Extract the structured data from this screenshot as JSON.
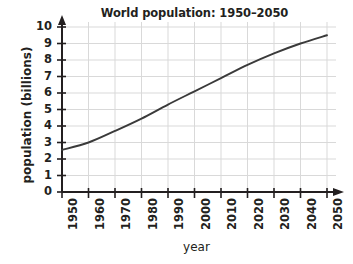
{
  "chart_data": {
    "type": "line",
    "title": "World population: 1950–2050",
    "xlabel": "year",
    "ylabel": "population (billions)",
    "xlim": [
      1950,
      2050
    ],
    "ylim": [
      0,
      10
    ],
    "grid": true,
    "legend": "none",
    "x_ticks": [
      "1950",
      "1960",
      "1970",
      "1980",
      "1990",
      "2000",
      "2010",
      "2020",
      "2030",
      "2040",
      "2050"
    ],
    "y_ticks": [
      "0",
      "1",
      "2",
      "3",
      "4",
      "5",
      "6",
      "7",
      "8",
      "9",
      "10"
    ],
    "x": [
      1950,
      1960,
      1970,
      1980,
      1990,
      2000,
      2010,
      2020,
      2030,
      2040,
      2050
    ],
    "values": [
      2.55,
      3.0,
      3.7,
      4.45,
      5.3,
      6.1,
      6.9,
      7.7,
      8.4,
      9.0,
      9.5
    ],
    "series": [
      {
        "name": "world population",
        "values": [
          2.55,
          3.0,
          3.7,
          4.45,
          5.3,
          6.1,
          6.9,
          7.7,
          8.4,
          9.0,
          9.5
        ],
        "color": "#3a3a3a"
      }
    ],
    "colors": {
      "line": "#3a3a3a",
      "axis": "#231f20",
      "grid": "#d9d9d9",
      "text": "#231f20",
      "background": "#ffffff"
    }
  }
}
